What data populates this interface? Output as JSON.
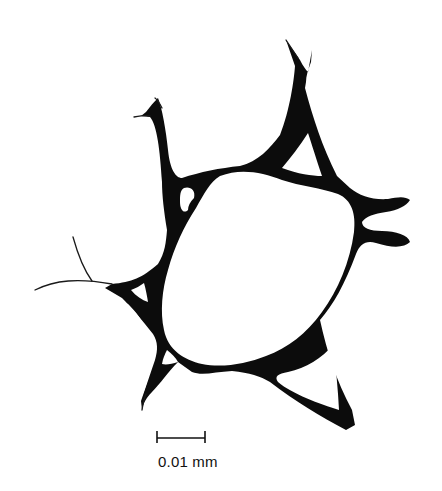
{
  "figure": {
    "colors": {
      "wall": "#0c0c0c",
      "background": "#ffffff"
    },
    "scale_bar": {
      "label": "0.01 mm",
      "x1": 157,
      "x2": 205,
      "y": 438
    }
  }
}
